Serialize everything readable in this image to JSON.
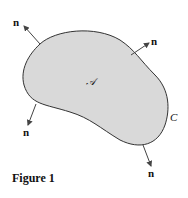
{
  "figure": {
    "caption": "Figure 1",
    "region_label": "𝒜",
    "curve_label": "C",
    "normal_label": "n",
    "fill_color": "#d9d9d9",
    "stroke_color": "#333333",
    "normals": [
      {
        "id": "top-left",
        "label": "n"
      },
      {
        "id": "top-right",
        "label": "n"
      },
      {
        "id": "bottom-left",
        "label": "n"
      },
      {
        "id": "bottom-right",
        "label": "n"
      }
    ]
  }
}
